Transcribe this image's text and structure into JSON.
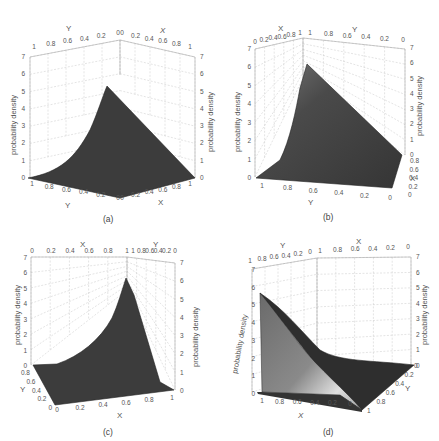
{
  "chart_data": [
    {
      "type": "surface3d",
      "panel": "a",
      "caption": "(a)",
      "zlabel": "probability density",
      "xlabel": "X",
      "ylabel": "Y",
      "xlim": [
        0,
        1
      ],
      "ylim": [
        0,
        1
      ],
      "zlim": [
        0,
        7
      ],
      "x_ticks": [
        "0",
        "0.2",
        "0.4",
        "0.6",
        "0.8",
        "1"
      ],
      "y_ticks": [
        "1",
        "0.8",
        "0.6",
        "0.4",
        "0.2",
        "0"
      ],
      "z_ticks": [
        "0",
        "1",
        "2",
        "3",
        "4",
        "5",
        "6",
        "7"
      ],
      "peak": {
        "x": 0,
        "y": 0,
        "z": 5.3
      },
      "grid": true
    },
    {
      "type": "surface3d",
      "panel": "b",
      "caption": "(b)",
      "zlabel": "probability density",
      "xlabel": "X",
      "ylabel": "Y",
      "xlim": [
        0,
        1
      ],
      "ylim": [
        0,
        1
      ],
      "zlim": [
        0,
        7
      ],
      "top_x_ticks": [
        "0",
        "0.2",
        "0.4",
        "0.6",
        "0.8",
        "1"
      ],
      "top_y_ticks": [
        "1",
        "0.8",
        "0.6",
        "0.4",
        "0.2",
        "0"
      ],
      "bottom_y_ticks": [
        "1",
        "0.8",
        "0.6",
        "0.4",
        "0.2",
        "0"
      ],
      "side_x_ticks": [
        "0",
        "0.2",
        "0.4",
        "0.6",
        "0.8"
      ],
      "z_ticks": [
        "0",
        "1",
        "2",
        "3",
        "4",
        "5",
        "6",
        "7"
      ],
      "peak": {
        "z": 6.1
      },
      "grid": true
    },
    {
      "type": "surface3d",
      "panel": "c",
      "caption": "(c)",
      "zlabel": "probability density",
      "xlabel": "X",
      "ylabel": "Y",
      "xlim": [
        0,
        1
      ],
      "ylim": [
        0,
        1
      ],
      "zlim": [
        0,
        7
      ],
      "top_x_ticks": [
        "0",
        "0.2",
        "0.4",
        "0.6",
        "0.8",
        "1"
      ],
      "top_y_ticks": [
        "1",
        "0.8",
        "0.6",
        "0.4",
        "0.2",
        "0"
      ],
      "bottom_x_ticks": [
        "0",
        "0.2",
        "0.4",
        "0.6",
        "0.8",
        "1"
      ],
      "side_y_ticks": [
        "0",
        "0.2",
        "0.4",
        "0.6",
        "0.8"
      ],
      "z_ticks": [
        "0",
        "1",
        "2",
        "3",
        "4",
        "5",
        "6",
        "7"
      ],
      "peak": {
        "z": 5.8
      },
      "grid": true
    },
    {
      "type": "surface3d",
      "panel": "d",
      "caption": "(d)",
      "zlabel": "probability density",
      "xlabel": "X",
      "ylabel": "Y",
      "xlim": [
        0,
        1
      ],
      "ylim": [
        0,
        1
      ],
      "zlim": [
        0,
        7
      ],
      "top_y_ticks": [
        "1",
        "0.8",
        "0.6",
        "0.4",
        "0.2",
        "0"
      ],
      "top_x_ticks": [
        "1",
        "0.8",
        "0.6",
        "0.4",
        "0.2",
        "0"
      ],
      "bottom_x_ticks": [
        "1",
        "0.8",
        "0.6",
        "0.4",
        "0.2",
        "0"
      ],
      "side_y_ticks": [
        "0",
        "0.2",
        "0.4",
        "0.6",
        "0.8",
        "1"
      ],
      "z_ticks": [
        "0",
        "1",
        "2",
        "3",
        "4",
        "5",
        "6",
        "7"
      ],
      "peak": {
        "z": 5.7
      },
      "grid": true
    }
  ],
  "surface_color": "#3c3c3c",
  "highlight_color": "#d8d8d8"
}
